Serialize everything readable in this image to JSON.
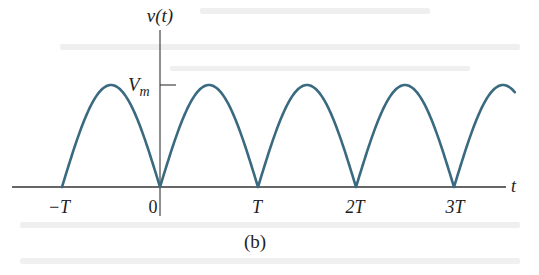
{
  "figure": {
    "caption": "(b)",
    "y_axis_label": "v(t)",
    "x_axis_label": "t",
    "amplitude_label": "V",
    "amplitude_label_subscript": "m",
    "tick_labels": [
      "−T",
      "0",
      "T",
      "2T",
      "3T"
    ]
  },
  "colors": {
    "curve": "#3a6a80",
    "axis": "#333333",
    "text": "#1e1e1e",
    "background": "#ffffff"
  },
  "chart_data": {
    "type": "line",
    "title": "",
    "subtitle": "(b)",
    "xlabel": "t",
    "ylabel": "v(t)",
    "x_ticks": [
      {
        "label": "−T",
        "value": -1
      },
      {
        "label": "0",
        "value": 0
      },
      {
        "label": "T",
        "value": 1
      },
      {
        "label": "2T",
        "value": 2
      },
      {
        "label": "3T",
        "value": 3
      }
    ],
    "y_ticks": [
      {
        "label": "Vm",
        "value": 1
      }
    ],
    "x_units": "T",
    "y_units": "Vm",
    "xlim": [
      -1.0,
      3.65
    ],
    "ylim": [
      0,
      1.0
    ],
    "series": [
      {
        "name": "v(t)",
        "function": "Vm*|sin(pi*t/T)|",
        "x": [
          -1.0,
          -0.75,
          -0.5,
          -0.25,
          0,
          0.25,
          0.5,
          0.75,
          1.0,
          1.25,
          1.5,
          1.75,
          2.0,
          2.25,
          2.5,
          2.75,
          3.0,
          3.25,
          3.5,
          3.6
        ],
        "values": [
          0,
          0.707,
          1.0,
          0.707,
          0,
          0.707,
          1.0,
          0.707,
          0,
          0.707,
          1.0,
          0.707,
          0,
          0.707,
          1.0,
          0.707,
          0,
          0.707,
          1.0,
          0.951
        ]
      }
    ],
    "grid": false,
    "legend": null
  }
}
